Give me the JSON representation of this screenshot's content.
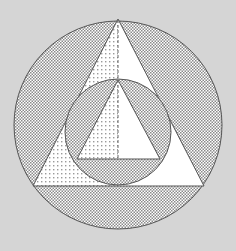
{
  "diagram": {
    "colors": {
      "background": "#d5d5d5",
      "white_fill": "#ffffff",
      "stroke": "#555555",
      "dense_pattern": "#8a8a8a",
      "sparse_pattern": "#9a9a9a"
    },
    "outer_circle": {
      "cx": 118,
      "cy": 125,
      "r": 104
    },
    "big_triangle": {
      "apex": [
        118,
        19
      ],
      "left": [
        33,
        186
      ],
      "right": [
        204,
        186
      ]
    },
    "inner_circle": {
      "cx": 118,
      "cy": 132,
      "r": 53
    },
    "small_triangle": {
      "apex": [
        118,
        80
      ],
      "left": [
        77,
        159
      ],
      "right": [
        160,
        159
      ]
    },
    "axis_line": {
      "x": 118,
      "y1": 19,
      "y2": 159,
      "style": "dashed"
    },
    "regions": [
      {
        "name": "outer-ring-region",
        "fill": "dense-checker"
      },
      {
        "name": "big-triangle-left-half",
        "fill": "sparse-dots"
      },
      {
        "name": "big-triangle-right-half",
        "fill": "white"
      },
      {
        "name": "inner-circle-segments",
        "fill": "dense-checker"
      },
      {
        "name": "small-triangle-left-half",
        "fill": "sparse-dots"
      },
      {
        "name": "small-triangle-right-half",
        "fill": "white"
      }
    ]
  }
}
